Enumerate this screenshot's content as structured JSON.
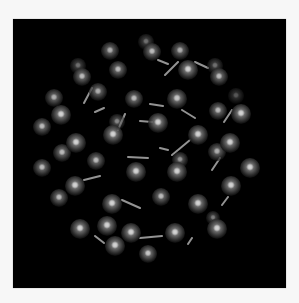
{
  "figure": {
    "title": "C60 fullerene ball-and-stick model",
    "background_color": "#000000",
    "page_color": "#f7f7f7",
    "atom_color": "#8a8a8a",
    "highlight_color": "#ffffff",
    "bond_color": "#b8b8b8"
  },
  "atoms": [
    {
      "x": 146,
      "y": 42,
      "r": 8,
      "depth": 0.45
    },
    {
      "x": 152,
      "y": 52,
      "r": 9,
      "depth": 0.75
    },
    {
      "x": 110,
      "y": 51,
      "r": 9,
      "depth": 0.7
    },
    {
      "x": 180,
      "y": 51,
      "r": 9,
      "depth": 0.7
    },
    {
      "x": 78,
      "y": 66,
      "r": 8,
      "depth": 0.45
    },
    {
      "x": 82,
      "y": 77,
      "r": 9,
      "depth": 0.75
    },
    {
      "x": 118,
      "y": 70,
      "r": 9,
      "depth": 0.75
    },
    {
      "x": 188,
      "y": 70,
      "r": 10,
      "depth": 0.85
    },
    {
      "x": 215,
      "y": 66,
      "r": 8,
      "depth": 0.45
    },
    {
      "x": 219,
      "y": 77,
      "r": 9,
      "depth": 0.75
    },
    {
      "x": 98,
      "y": 92,
      "r": 9,
      "depth": 0.7
    },
    {
      "x": 54,
      "y": 98,
      "r": 9,
      "depth": 0.7
    },
    {
      "x": 134,
      "y": 99,
      "r": 9,
      "depth": 0.75
    },
    {
      "x": 177,
      "y": 99,
      "r": 10,
      "depth": 0.8
    },
    {
      "x": 236,
      "y": 96,
      "r": 8,
      "depth": 0.35
    },
    {
      "x": 218,
      "y": 111,
      "r": 9,
      "depth": 0.75
    },
    {
      "x": 241,
      "y": 114,
      "r": 10,
      "depth": 0.85
    },
    {
      "x": 61,
      "y": 115,
      "r": 10,
      "depth": 0.85
    },
    {
      "x": 117,
      "y": 122,
      "r": 8,
      "depth": 0.55
    },
    {
      "x": 158,
      "y": 123,
      "r": 10,
      "depth": 0.85
    },
    {
      "x": 42,
      "y": 127,
      "r": 9,
      "depth": 0.75
    },
    {
      "x": 113,
      "y": 135,
      "r": 10,
      "depth": 0.85
    },
    {
      "x": 198,
      "y": 135,
      "r": 10,
      "depth": 0.85
    },
    {
      "x": 76,
      "y": 143,
      "r": 10,
      "depth": 0.85
    },
    {
      "x": 230,
      "y": 143,
      "r": 10,
      "depth": 0.85
    },
    {
      "x": 62,
      "y": 153,
      "r": 9,
      "depth": 0.75
    },
    {
      "x": 217,
      "y": 152,
      "r": 9,
      "depth": 0.7
    },
    {
      "x": 96,
      "y": 161,
      "r": 9,
      "depth": 0.75
    },
    {
      "x": 180,
      "y": 160,
      "r": 8,
      "depth": 0.6
    },
    {
      "x": 42,
      "y": 168,
      "r": 9,
      "depth": 0.75
    },
    {
      "x": 136,
      "y": 172,
      "r": 10,
      "depth": 0.85
    },
    {
      "x": 177,
      "y": 172,
      "r": 10,
      "depth": 0.85
    },
    {
      "x": 250,
      "y": 168,
      "r": 10,
      "depth": 0.85
    },
    {
      "x": 75,
      "y": 186,
      "r": 10,
      "depth": 0.85
    },
    {
      "x": 231,
      "y": 186,
      "r": 10,
      "depth": 0.85
    },
    {
      "x": 59,
      "y": 198,
      "r": 9,
      "depth": 0.75
    },
    {
      "x": 161,
      "y": 197,
      "r": 9,
      "depth": 0.75
    },
    {
      "x": 112,
      "y": 204,
      "r": 10,
      "depth": 0.85
    },
    {
      "x": 198,
      "y": 204,
      "r": 10,
      "depth": 0.85
    },
    {
      "x": 213,
      "y": 218,
      "r": 7,
      "depth": 0.5
    },
    {
      "x": 80,
      "y": 229,
      "r": 10,
      "depth": 0.85
    },
    {
      "x": 107,
      "y": 226,
      "r": 10,
      "depth": 0.85
    },
    {
      "x": 131,
      "y": 233,
      "r": 10,
      "depth": 0.85
    },
    {
      "x": 175,
      "y": 233,
      "r": 10,
      "depth": 0.85
    },
    {
      "x": 217,
      "y": 229,
      "r": 10,
      "depth": 0.85
    },
    {
      "x": 115,
      "y": 246,
      "r": 10,
      "depth": 0.85
    },
    {
      "x": 148,
      "y": 254,
      "r": 9,
      "depth": 0.8
    }
  ],
  "bonds": [
    {
      "x1": 84,
      "y1": 103,
      "x2": 92,
      "y2": 88
    },
    {
      "x1": 118,
      "y1": 130,
      "x2": 125,
      "y2": 114
    },
    {
      "x1": 165,
      "y1": 75,
      "x2": 178,
      "y2": 62
    },
    {
      "x1": 195,
      "y1": 62,
      "x2": 208,
      "y2": 68
    },
    {
      "x1": 150,
      "y1": 104,
      "x2": 163,
      "y2": 106
    },
    {
      "x1": 182,
      "y1": 110,
      "x2": 195,
      "y2": 118
    },
    {
      "x1": 224,
      "y1": 122,
      "x2": 232,
      "y2": 110
    },
    {
      "x1": 212,
      "y1": 170,
      "x2": 220,
      "y2": 158
    },
    {
      "x1": 140,
      "y1": 121,
      "x2": 152,
      "y2": 122
    },
    {
      "x1": 128,
      "y1": 157,
      "x2": 148,
      "y2": 158
    },
    {
      "x1": 84,
      "y1": 180,
      "x2": 100,
      "y2": 176
    },
    {
      "x1": 122,
      "y1": 200,
      "x2": 140,
      "y2": 208
    },
    {
      "x1": 95,
      "y1": 236,
      "x2": 104,
      "y2": 243
    },
    {
      "x1": 140,
      "y1": 238,
      "x2": 162,
      "y2": 236
    },
    {
      "x1": 172,
      "y1": 155,
      "x2": 190,
      "y2": 140
    },
    {
      "x1": 222,
      "y1": 205,
      "x2": 228,
      "y2": 197
    },
    {
      "x1": 188,
      "y1": 244,
      "x2": 192,
      "y2": 238
    },
    {
      "x1": 160,
      "y1": 148,
      "x2": 168,
      "y2": 150
    },
    {
      "x1": 95,
      "y1": 112,
      "x2": 104,
      "y2": 108
    },
    {
      "x1": 158,
      "y1": 60,
      "x2": 168,
      "y2": 64
    }
  ]
}
